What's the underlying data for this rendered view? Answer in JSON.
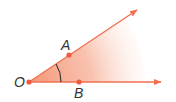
{
  "diagram": {
    "type": "angle",
    "vertex": {
      "label": "O",
      "x": 29,
      "y": 82
    },
    "points": [
      {
        "label": "A",
        "x": 69,
        "y": 55,
        "label_x": 61,
        "label_y": 50
      },
      {
        "label": "B",
        "x": 79,
        "y": 82,
        "label_x": 74,
        "label_y": 98
      }
    ],
    "rays": [
      {
        "name": "OA",
        "end_x": 138,
        "end_y": 9
      },
      {
        "name": "OB",
        "end_x": 162,
        "end_y": 82
      }
    ],
    "angle_marker": "single arc",
    "colors": {
      "ray": "#f07050",
      "point": "#f05a3c",
      "fill": "#f5a080",
      "label": "#333333"
    }
  }
}
